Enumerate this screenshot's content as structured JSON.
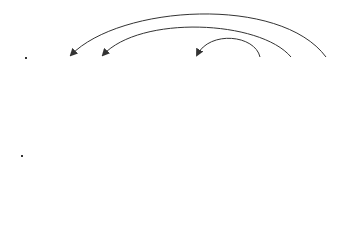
{
  "top": {
    "label": "copy",
    "cells": [
      {
        "id": "0",
        "star": false
      },
      {
        "id": "1",
        "star": true
      },
      {
        "id": "2",
        "star": true
      },
      {
        "id": "3",
        "star": false
      },
      {
        "id": "4",
        "star": false
      },
      {
        "id": "5",
        "star": true
      },
      {
        "id": "6",
        "star": true
      },
      {
        "id": "7",
        "star": false
      },
      {
        "id": "8",
        "star": false
      },
      {
        "id": "9",
        "star": false
      }
    ],
    "arrows": [
      {
        "from": "9",
        "to": "1"
      },
      {
        "from": "8",
        "to": "2"
      },
      {
        "from": "7",
        "to": "5"
      }
    ]
  },
  "bottom": {
    "label": "shorten and re-number",
    "cells": [
      "0",
      "9",
      "8",
      "3",
      "4",
      "7"
    ],
    "indices": [
      "0",
      "1",
      "2",
      "3",
      "4",
      "5"
    ]
  }
}
